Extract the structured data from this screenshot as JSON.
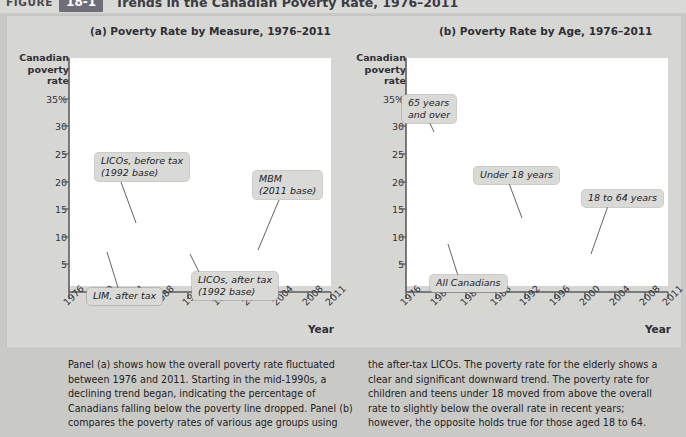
{
  "header": {
    "figure_word": "FIGURE",
    "figure_number": "18-1",
    "title": "Trends in the Canadian Poverty Rate, 1976–2011"
  },
  "panels": {
    "a_title": "(a) Poverty Rate by Measure, 1976–2011",
    "b_title": "(b) Poverty Rate by Age, 1976–2011"
  },
  "axis": {
    "y_title_line1": "Canadian",
    "y_title_line2": "poverty",
    "y_title_line3": "rate",
    "x_title": "Year",
    "y_ticks": [
      "35%",
      "30",
      "25",
      "20",
      "15",
      "10",
      "5"
    ],
    "x_ticks": [
      "1976",
      "1980",
      "1984",
      "1988",
      "1992",
      "1996",
      "2000",
      "2004",
      "2008",
      "2011"
    ]
  },
  "callouts": {
    "a": [
      {
        "id": "licos-before-tax",
        "line1": "LICOs, before tax",
        "line2": "(1992 base)"
      },
      {
        "id": "mbm",
        "line1": "MBM",
        "line2": "(2011 base)"
      },
      {
        "id": "lim-after-tax",
        "line1": "LIM, after tax",
        "line2": ""
      },
      {
        "id": "licos-after-tax",
        "line1": "LICOs, after tax",
        "line2": "(1992 base)"
      }
    ],
    "b": [
      {
        "id": "65-and-over",
        "line1": "65 years",
        "line2": "and over"
      },
      {
        "id": "under-18",
        "line1": "Under 18 years",
        "line2": ""
      },
      {
        "id": "18-to-64",
        "line1": "18 to 64 years",
        "line2": ""
      },
      {
        "id": "all-canadians",
        "line1": "All Canadians",
        "line2": ""
      }
    ]
  },
  "colors": {
    "dark_line": "#4a4a52",
    "mid_line": "#6d6d75",
    "light_line": "#aeaeb2",
    "panel_bg": "#d6d6d3",
    "page_bg": "#c9c9c6",
    "plot_bg": "#ffffff",
    "badge_bg": "#6e6e78"
  },
  "caption": {
    "left": "Panel (a) shows how the overall poverty rate fluctuated between 1976 and 2011. Starting in the mid-1990s, a declining trend began, indicating the percentage of Canadians falling below the poverty line dropped. Panel (b) compares the poverty rates of various age groups using",
    "right": "the after-tax LICOs. The poverty rate for the elderly shows a clear and significant downward trend. The poverty rate for children and teens under 18 moved from above the overall rate to slightly below the overall rate in recent years; however, the opposite holds true for those aged 18 to 64."
  },
  "chart_data": [
    {
      "type": "line",
      "panel": "a",
      "title": "(a) Poverty Rate by Measure, 1976–2011",
      "xlabel": "Year",
      "ylabel": "Canadian poverty rate",
      "xlim": [
        1976,
        2011
      ],
      "ylim": [
        0,
        37
      ],
      "yticks": [
        5,
        10,
        15,
        20,
        25,
        30,
        35
      ],
      "xticks": [
        1976,
        1980,
        1984,
        1988,
        1992,
        1996,
        2000,
        2004,
        2008,
        2011
      ],
      "grid": false,
      "legend": "inline-callouts",
      "x": [
        1976,
        1977,
        1978,
        1979,
        1980,
        1981,
        1982,
        1983,
        1984,
        1985,
        1986,
        1987,
        1988,
        1989,
        1990,
        1991,
        1992,
        1993,
        1994,
        1995,
        1996,
        1997,
        1998,
        1999,
        2000,
        2001,
        2002,
        2003,
        2004,
        2005,
        2006,
        2007,
        2008,
        2009,
        2010,
        2011
      ],
      "series": [
        {
          "name": "LICOs, before tax (1992 base)",
          "color": "#4a4a52",
          "values": [
            17.8,
            17.4,
            17.2,
            16.5,
            16.5,
            15.7,
            17.0,
            18.2,
            18.5,
            17.6,
            17.0,
            16.5,
            15.8,
            15.1,
            15.6,
            16.6,
            16.8,
            17.9,
            17.0,
            17.6,
            19.1,
            19.6,
            18.2,
            17.6,
            17.1,
            16.3,
            16.1,
            16.4,
            16.4,
            15.8,
            15.7,
            15.0,
            14.9,
            14.8,
            14.0,
            14.0
          ]
        },
        {
          "name": "LIM, after tax",
          "color": "#6d6d75",
          "values": [
            13.2,
            13.4,
            13.1,
            12.9,
            12.8,
            12.3,
            13.2,
            14.2,
            14.0,
            13.4,
            13.0,
            12.8,
            12.5,
            12.2,
            12.4,
            12.9,
            13.2,
            13.8,
            13.5,
            14.2,
            14.8,
            15.3,
            14.5,
            14.0,
            13.5,
            13.0,
            12.8,
            13.1,
            13.2,
            13.1,
            13.2,
            13.0,
            13.2,
            13.3,
            13.4,
            13.2
          ]
        },
        {
          "name": "LICOs, after tax (1992 base)",
          "color": "#4a4a52",
          "values": [
            13.1,
            13.2,
            12.9,
            12.7,
            12.4,
            11.9,
            12.3,
            13.3,
            13.1,
            12.7,
            12.2,
            11.9,
            11.6,
            11.2,
            11.5,
            12.2,
            12.7,
            13.1,
            12.6,
            12.8,
            13.1,
            13.3,
            12.8,
            12.2,
            11.8,
            11.2,
            11.2,
            11.5,
            11.4,
            10.9,
            10.5,
            9.5,
            9.3,
            9.7,
            9.5,
            9.0
          ]
        },
        {
          "name": "MBM (2011 base)",
          "color": "#aeaeb2",
          "values": [
            null,
            null,
            null,
            null,
            null,
            null,
            null,
            null,
            null,
            null,
            null,
            null,
            null,
            null,
            null,
            null,
            null,
            null,
            null,
            null,
            null,
            null,
            null,
            null,
            12.9,
            12.8,
            12.6,
            12.8,
            12.7,
            12.3,
            11.3,
            10.0,
            9.9,
            10.7,
            12.2,
            12.6
          ]
        }
      ]
    },
    {
      "type": "line",
      "panel": "b",
      "title": "(b) Poverty Rate by Age, 1976–2011",
      "xlabel": "Year",
      "ylabel": "Canadian poverty rate",
      "xlim": [
        1976,
        2011
      ],
      "ylim": [
        0,
        37
      ],
      "yticks": [
        5,
        10,
        15,
        20,
        25,
        30,
        35
      ],
      "xticks": [
        1976,
        1980,
        1984,
        1988,
        1992,
        1996,
        2000,
        2004,
        2008,
        2011
      ],
      "grid": false,
      "legend": "inline-callouts",
      "x": [
        1976,
        1977,
        1978,
        1979,
        1980,
        1981,
        1982,
        1983,
        1984,
        1985,
        1986,
        1987,
        1988,
        1989,
        1990,
        1991,
        1992,
        1993,
        1994,
        1995,
        1996,
        1997,
        1998,
        1999,
        2000,
        2001,
        2002,
        2003,
        2004,
        2005,
        2006,
        2007,
        2008,
        2009,
        2010,
        2011
      ],
      "series": [
        {
          "name": "65 years and over",
          "color": "#4a4a52",
          "values": [
            29.0,
            30.2,
            29.0,
            27.6,
            26.5,
            24.0,
            22.0,
            21.0,
            19.2,
            19.8,
            19.4,
            17.0,
            14.0,
            12.0,
            10.6,
            10.0,
            9.6,
            9.0,
            8.6,
            8.4,
            9.0,
            9.6,
            8.6,
            8.0,
            7.6,
            6.9,
            6.8,
            6.6,
            5.9,
            5.8,
            5.5,
            5.3,
            5.8,
            5.2,
            5.3,
            5.2
          ]
        },
        {
          "name": "Under 18 years",
          "color": "#6d6d75",
          "values": [
            13.0,
            13.2,
            12.8,
            12.4,
            12.1,
            11.6,
            12.8,
            14.6,
            15.6,
            15.0,
            14.3,
            13.8,
            13.4,
            12.2,
            12.8,
            14.6,
            16.4,
            17.0,
            16.8,
            17.6,
            18.6,
            18.0,
            17.0,
            16.2,
            15.3,
            14.2,
            13.0,
            12.2,
            12.1,
            11.8,
            11.2,
            10.0,
            9.4,
            9.5,
            9.0,
            8.8
          ]
        },
        {
          "name": "18 to 64 years",
          "color": "#aeaeb2",
          "values": [
            10.7,
            10.6,
            10.5,
            10.4,
            10.3,
            10.2,
            11.0,
            11.8,
            12.2,
            12.0,
            11.7,
            11.6,
            11.4,
            11.0,
            11.3,
            12.2,
            13.0,
            13.8,
            13.6,
            14.3,
            15.1,
            15.4,
            14.6,
            14.0,
            13.5,
            12.6,
            12.5,
            12.4,
            12.2,
            11.7,
            11.2,
            10.6,
            10.2,
            10.4,
            10.0,
            9.9
          ]
        },
        {
          "name": "All Canadians",
          "color": "#4a4a52",
          "values": [
            13.4,
            13.5,
            13.2,
            12.9,
            12.6,
            12.2,
            12.8,
            14.0,
            14.0,
            13.4,
            12.9,
            12.6,
            12.3,
            11.8,
            12.0,
            12.8,
            13.4,
            14.0,
            13.7,
            14.2,
            14.9,
            15.2,
            14.4,
            13.8,
            13.0,
            12.2,
            12.0,
            11.9,
            11.8,
            11.4,
            11.0,
            10.2,
            9.8,
            10.0,
            9.2,
            8.9
          ]
        }
      ]
    }
  ]
}
